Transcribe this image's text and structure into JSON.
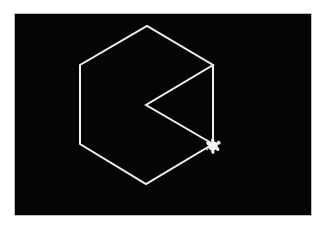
{
  "scene": {
    "type": "turtle-graphics",
    "background_color": "#050505",
    "line_color": "#f0f0f0",
    "line_width": 2,
    "path": [
      [
        213,
        144
      ],
      [
        146,
        105
      ],
      [
        213,
        65
      ],
      [
        147,
        26
      ],
      [
        80,
        65
      ],
      [
        80,
        144
      ],
      [
        146,
        184
      ],
      [
        213,
        144
      ],
      [
        213,
        65
      ]
    ],
    "turtle": {
      "x": 213,
      "y": 146,
      "heading_deg": -30,
      "color": "#f2f2f2"
    }
  }
}
